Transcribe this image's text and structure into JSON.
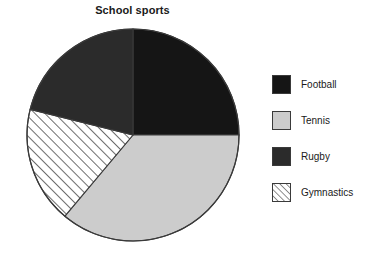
{
  "chart_data": {
    "type": "pie",
    "title": "School sports",
    "xlabel": "",
    "ylabel": "",
    "legend_position": "right",
    "grid": false,
    "categories": [
      "Football",
      "Tennis",
      "Rugby",
      "Gymnastics"
    ],
    "values": [
      25,
      36,
      21,
      18
    ],
    "units": "percent",
    "slices": [
      {
        "label": "Football",
        "value": 25,
        "start_angle_deg": 0,
        "end_angle_deg": 90,
        "color": "#151515",
        "pattern": "solid"
      },
      {
        "label": "Tennis",
        "value": 36,
        "start_angle_deg": 90,
        "end_angle_deg": 220,
        "color": "#cccccc",
        "pattern": "solid"
      },
      {
        "label": "Gymnastics",
        "value": 18,
        "start_angle_deg": 220,
        "end_angle_deg": 284,
        "color": "#ffffff",
        "pattern": "diagonal-hatch"
      },
      {
        "label": "Rugby",
        "value": 21,
        "start_angle_deg": 284,
        "end_angle_deg": 360,
        "color": "#2b2b2b",
        "pattern": "solid"
      }
    ]
  },
  "chart": {
    "title": "School sports",
    "outline_color": "#3a3a3a"
  },
  "legend": {
    "items": [
      {
        "label": "Football",
        "color": "#151515",
        "pattern": "solid",
        "swatch_name": "legend-swatch-football"
      },
      {
        "label": "Tennis",
        "color": "#cccccc",
        "pattern": "solid",
        "swatch_name": "legend-swatch-tennis"
      },
      {
        "label": "Rugby",
        "color": "#2b2b2b",
        "pattern": "solid",
        "swatch_name": "legend-swatch-rugby"
      },
      {
        "label": "Gymnastics",
        "color": "#ffffff",
        "pattern": "diagonal-hatch",
        "swatch_name": "legend-swatch-gymnastics"
      }
    ]
  }
}
